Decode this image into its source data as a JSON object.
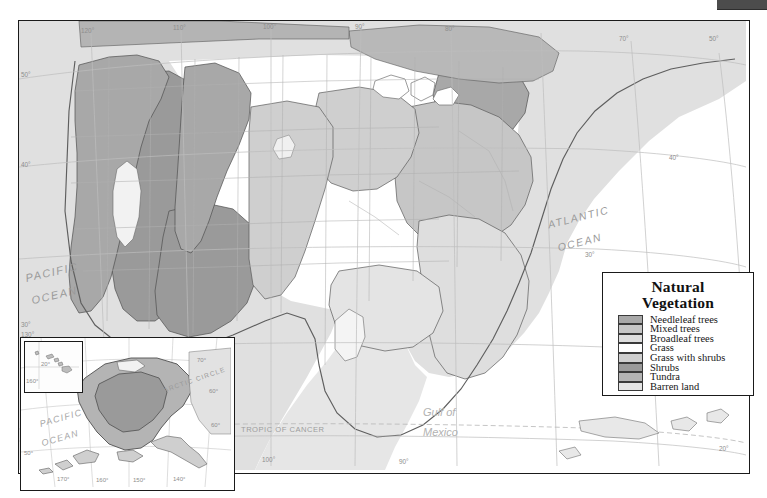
{
  "legend": {
    "title_line1": "Natural",
    "title_line2": "Vegetation",
    "items": [
      {
        "label": "Needleleaf trees",
        "color": "#a8a8a8"
      },
      {
        "label": "Mixed trees",
        "color": "#c6c6c6"
      },
      {
        "label": "Broadleaf trees",
        "color": "#dedede"
      },
      {
        "label": "Grass",
        "color": "#ffffff"
      },
      {
        "label": "Grass with shrubs",
        "color": "#cfcfcf"
      },
      {
        "label": "Shrubs",
        "color": "#9a9a9a"
      },
      {
        "label": "Tundra",
        "color": "#b4b4b4"
      },
      {
        "label": "Barren land",
        "color": "#e4e4e4"
      }
    ]
  },
  "map": {
    "ocean_labels": [
      {
        "name": "pacific-ocean",
        "line1": "PACIFIC",
        "line2": "OCEAN"
      },
      {
        "name": "atlantic-ocean",
        "line1": "ATLANTIC",
        "line2": "OCEAN"
      }
    ],
    "gulf_label": {
      "line1": "Gulf of",
      "line2": "Mexico"
    },
    "tropic_label": "TROPIC OF CANCER",
    "graticule_top": [
      "120°",
      "110°",
      "100°",
      "90°",
      "80°",
      "70°"
    ],
    "graticule_bottom": [
      "100°",
      "90°"
    ],
    "graticule_left": [
      "50°",
      "40°",
      "30°"
    ],
    "graticule_right": [
      "50°",
      "40°",
      "30°",
      "20°"
    ],
    "graticule_misc": [
      "130°",
      "120°",
      "110°"
    ]
  },
  "alaska_inset": {
    "arctic_circle": "ARCTIC CIRCLE",
    "ocean_line1": "PACIFIC",
    "ocean_line2": "OCEAN",
    "lon_labels": [
      "170°",
      "160°",
      "150°",
      "140°"
    ],
    "lat_labels": [
      "70°",
      "60°",
      "60°"
    ],
    "left_lat": "50°"
  },
  "hawaii_inset": {
    "lat_label": "20°",
    "lon_label": "160°"
  }
}
